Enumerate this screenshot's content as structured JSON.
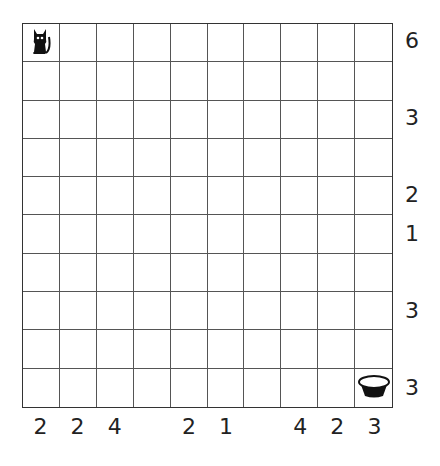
{
  "puzzle": {
    "rows": 10,
    "cols": 10,
    "start": {
      "row": 0,
      "col": 0,
      "icon": "cat-icon"
    },
    "goal": {
      "row": 9,
      "col": 9,
      "icon": "bowl-icon"
    },
    "row_clues": [
      "6",
      "",
      "3",
      "",
      "2",
      "1",
      "",
      "3",
      "",
      "3"
    ],
    "col_clues": [
      "2",
      "2",
      "4",
      "",
      "2",
      "1",
      "",
      "4",
      "2",
      "3"
    ]
  }
}
